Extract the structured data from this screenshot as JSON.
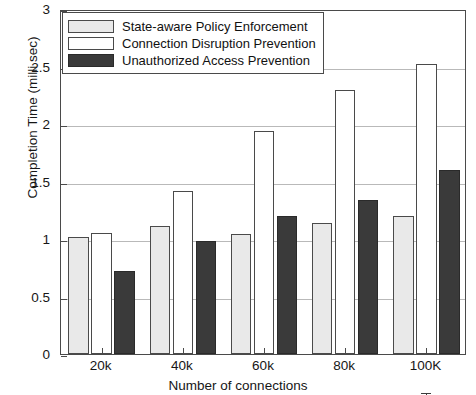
{
  "chart_data": {
    "type": "bar",
    "title": "",
    "xlabel": "Number of connections",
    "ylabel": "Completion Time (milli sec)",
    "categories": [
      "20k",
      "40k",
      "60k",
      "80k",
      "100K"
    ],
    "ylim": [
      0,
      3
    ],
    "yticks": [
      "0",
      "0.5",
      "1",
      "1.5",
      "2",
      "2.5",
      "3"
    ],
    "ytick_values": [
      0,
      0.5,
      1,
      1.5,
      2,
      2.5,
      3
    ],
    "grid": true,
    "legend_position": "top-left",
    "series": [
      {
        "name": "State-aware Policy Enforcement",
        "color": "#e9e9e9",
        "values": [
          1.02,
          1.11,
          1.04,
          1.14,
          1.2
        ],
        "errors": [
          0.09,
          0.05,
          0.04,
          0.07,
          0.08
        ]
      },
      {
        "name": "Connection Disruption Prevention",
        "color": "#ffffff",
        "values": [
          1.05,
          1.42,
          1.94,
          2.3,
          2.52
        ],
        "errors": [
          0.04,
          0.02,
          0.07,
          0.12,
          0.14
        ]
      },
      {
        "name": "Unauthorized Access Prevention",
        "color": "#3a3a3a",
        "values": [
          0.72,
          0.98,
          1.2,
          1.34,
          1.6
        ]
      }
    ]
  },
  "legend": {
    "entries": [
      "State-aware Policy Enforcement",
      "Connection Disruption Prevention",
      "Unauthorized Access Prevention"
    ]
  },
  "axes": {
    "y_title": "Completion Time (milli sec)",
    "x_title": "Number of connections"
  }
}
